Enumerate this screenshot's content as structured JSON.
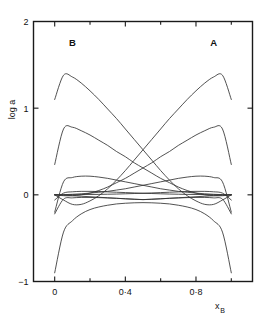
{
  "chart_data": {
    "type": "line",
    "title": "",
    "subtitle": "",
    "xlabel": "x",
    "xlabel_sub": "B",
    "ylabel": "log a",
    "xlim": [
      -0.12,
      1.12
    ],
    "ylim": [
      -1,
      2
    ],
    "grid": false,
    "legend_position": "in-plot-annotations",
    "xticks": [
      0,
      0.4,
      0.8
    ],
    "xtick_labels": [
      "0",
      "0·4",
      "0·8"
    ],
    "xtick_minor": [
      0.2,
      0.6,
      1.0
    ],
    "yticks": [
      -1,
      0,
      1,
      2
    ],
    "ytick_labels": [
      "1",
      "0",
      "1",
      "2"
    ],
    "ytick_labels_display": [
      "−1",
      "0",
      "1",
      "2"
    ],
    "annotations": [
      {
        "text": "B",
        "x": 0.1,
        "y": 1.72
      },
      {
        "text": "A",
        "x": 0.9,
        "y": 1.72
      }
    ],
    "x": [
      0.0,
      0.05,
      0.1,
      0.15,
      0.2,
      0.25,
      0.3,
      0.35,
      0.4,
      0.45,
      0.5,
      0.55,
      0.6,
      0.65,
      0.7,
      0.75,
      0.8,
      0.85,
      0.9,
      0.95,
      1.0
    ],
    "series": [
      {
        "name": "curve-1-left-tall-peak",
        "values": [
          1.1,
          1.38,
          1.36,
          1.29,
          1.2,
          1.1,
          0.99,
          0.88,
          0.76,
          0.64,
          0.52,
          0.4,
          0.28,
          0.17,
          0.07,
          -0.01,
          -0.07,
          -0.11,
          -0.11,
          -0.06,
          0.0
        ]
      },
      {
        "name": "curve-2-right-tall-peak",
        "values": [
          0.0,
          -0.06,
          -0.11,
          -0.11,
          -0.07,
          -0.01,
          0.07,
          0.17,
          0.28,
          0.4,
          0.52,
          0.64,
          0.76,
          0.88,
          0.99,
          1.1,
          1.2,
          1.29,
          1.36,
          1.38,
          1.1
        ]
      },
      {
        "name": "curve-3-left-mid-peak",
        "values": [
          0.35,
          0.76,
          0.78,
          0.74,
          0.69,
          0.63,
          0.57,
          0.5,
          0.44,
          0.37,
          0.31,
          0.25,
          0.19,
          0.14,
          0.09,
          0.05,
          0.02,
          0.0,
          -0.01,
          -0.01,
          0.0
        ]
      },
      {
        "name": "curve-4-right-mid-peak",
        "values": [
          0.0,
          -0.01,
          -0.01,
          0.0,
          0.02,
          0.05,
          0.09,
          0.14,
          0.19,
          0.25,
          0.31,
          0.37,
          0.44,
          0.5,
          0.57,
          0.63,
          0.69,
          0.74,
          0.78,
          0.76,
          0.35
        ]
      },
      {
        "name": "curve-5-left-low-hump",
        "values": [
          -0.2,
          0.15,
          0.2,
          0.215,
          0.215,
          0.205,
          0.19,
          0.17,
          0.15,
          0.13,
          0.11,
          0.09,
          0.07,
          0.055,
          0.04,
          0.03,
          0.02,
          0.012,
          0.006,
          0.002,
          0.0
        ]
      },
      {
        "name": "curve-6-right-low-hump",
        "values": [
          0.0,
          0.002,
          0.006,
          0.012,
          0.02,
          0.03,
          0.04,
          0.055,
          0.07,
          0.09,
          0.11,
          0.13,
          0.15,
          0.17,
          0.19,
          0.205,
          0.215,
          0.215,
          0.2,
          0.15,
          -0.2
        ]
      },
      {
        "name": "curve-7-left-shallow",
        "values": [
          -0.06,
          0.02,
          0.035,
          0.04,
          0.04,
          0.038,
          0.034,
          0.03,
          0.026,
          0.022,
          0.018,
          0.015,
          0.012,
          0.009,
          0.007,
          0.005,
          0.004,
          0.003,
          0.002,
          0.001,
          0.0
        ]
      },
      {
        "name": "curve-8-right-shallow",
        "values": [
          0.0,
          0.001,
          0.002,
          0.003,
          0.004,
          0.005,
          0.007,
          0.009,
          0.012,
          0.015,
          0.018,
          0.022,
          0.026,
          0.03,
          0.034,
          0.038,
          0.04,
          0.04,
          0.035,
          0.02,
          -0.06
        ]
      },
      {
        "name": "curve-9-left-shallow-dip",
        "values": [
          -0.22,
          -0.05,
          -0.035,
          -0.03,
          -0.03,
          -0.032,
          -0.036,
          -0.04,
          -0.045,
          -0.05,
          -0.055,
          -0.052,
          -0.046,
          -0.04,
          -0.034,
          -0.028,
          -0.022,
          -0.016,
          -0.01,
          -0.004,
          0.0
        ]
      },
      {
        "name": "curve-10-right-shallow-dip",
        "values": [
          0.0,
          -0.004,
          -0.01,
          -0.016,
          -0.022,
          -0.028,
          -0.034,
          -0.04,
          -0.046,
          -0.052,
          -0.055,
          -0.05,
          -0.045,
          -0.04,
          -0.036,
          -0.032,
          -0.03,
          -0.03,
          -0.035,
          -0.05,
          -0.22
        ]
      },
      {
        "name": "curve-11-bottom-broad-arch",
        "values": [
          -0.9,
          -0.43,
          -0.3,
          -0.22,
          -0.17,
          -0.14,
          -0.12,
          -0.105,
          -0.097,
          -0.092,
          -0.09,
          -0.092,
          -0.097,
          -0.105,
          -0.12,
          -0.14,
          -0.17,
          -0.22,
          -0.3,
          -0.43,
          -0.9
        ]
      }
    ]
  }
}
